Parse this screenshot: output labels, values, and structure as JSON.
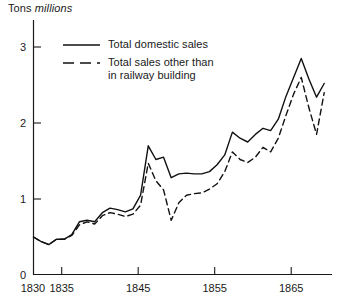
{
  "figure": {
    "y_axis_title_prefix": "Tons",
    "y_axis_title_unit": "millions"
  },
  "legend": {
    "entries": [
      {
        "style": "solid",
        "label": "Total domestic sales"
      },
      {
        "style": "dashed",
        "label": "Total sales other than\nin railway building"
      }
    ]
  },
  "chart_data": {
    "type": "line",
    "title": "Tons millions",
    "xlabel": "",
    "ylabel": "Tons millions",
    "xlim": [
      1830,
      1869
    ],
    "ylim": [
      0,
      3.2
    ],
    "xticks": [
      1830,
      1835,
      1845,
      1855,
      1865
    ],
    "xticklabels": [
      "1830",
      "1835",
      "1845",
      "1855",
      "1865"
    ],
    "yticks": [
      0,
      1,
      2,
      3
    ],
    "yticklabels": [
      "0",
      "1",
      "2",
      "3"
    ],
    "grid": false,
    "legend_position": "upper-left-inside",
    "x": [
      1830,
      1831,
      1832,
      1833,
      1834,
      1835,
      1836,
      1837,
      1838,
      1839,
      1840,
      1841,
      1842,
      1843,
      1844,
      1845,
      1846,
      1847,
      1848,
      1849,
      1850,
      1851,
      1852,
      1853,
      1854,
      1855,
      1856,
      1857,
      1858,
      1859,
      1860,
      1861,
      1862,
      1863,
      1864,
      1865,
      1866,
      1867,
      1868
    ],
    "series": [
      {
        "name": "Total domestic sales",
        "style": "solid",
        "color": "#111111",
        "values": [
          0.5,
          0.44,
          0.4,
          0.47,
          0.47,
          0.53,
          0.7,
          0.72,
          0.7,
          0.82,
          0.88,
          0.86,
          0.83,
          0.87,
          1.05,
          1.7,
          1.52,
          1.55,
          1.28,
          1.33,
          1.34,
          1.33,
          1.33,
          1.36,
          1.45,
          1.58,
          1.88,
          1.8,
          1.75,
          1.85,
          1.93,
          1.9,
          2.05,
          2.35,
          2.6,
          2.85,
          2.58,
          2.34,
          2.52
        ],
        "anchor_points": [
          {
            "x": 1830,
            "y": 0.5
          },
          {
            "x": 1845,
            "y": 1.7
          },
          {
            "x": 1848,
            "y": 1.28
          },
          {
            "x": 1856,
            "y": 1.88
          },
          {
            "x": 1865,
            "y": 2.85
          },
          {
            "x": 1868,
            "y": 2.52
          }
        ]
      },
      {
        "name": "Total sales other than in railway building",
        "style": "dashed",
        "color": "#111111",
        "values": [
          0.5,
          0.44,
          0.4,
          0.47,
          0.47,
          0.52,
          0.66,
          0.7,
          0.67,
          0.78,
          0.82,
          0.8,
          0.77,
          0.8,
          0.92,
          1.47,
          1.24,
          1.12,
          0.72,
          0.95,
          1.05,
          1.07,
          1.08,
          1.13,
          1.2,
          1.36,
          1.62,
          1.52,
          1.48,
          1.55,
          1.68,
          1.62,
          1.8,
          2.1,
          2.38,
          2.6,
          2.2,
          1.85,
          2.4
        ],
        "anchor_points": [
          {
            "x": 1845,
            "y": 1.47
          },
          {
            "x": 1848,
            "y": 0.72
          },
          {
            "x": 1865,
            "y": 2.6
          },
          {
            "x": 1867,
            "y": 1.85
          },
          {
            "x": 1868,
            "y": 2.4
          }
        ]
      }
    ]
  }
}
